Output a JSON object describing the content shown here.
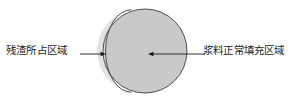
{
  "figure": {
    "type": "cross-section-diagram",
    "background_color": "#ffffff",
    "annotations": {
      "residue_label": "残渣所占区域",
      "slurry_label": "浆料正常填充区域"
    },
    "sphere": {
      "outline_color": "#4d4d4d",
      "center_x": 145,
      "center_y": 51,
      "radius": 42,
      "regions": [
        {
          "name": "residue-region",
          "label": "残渣所占区域",
          "fill_color": "#e2e2e2",
          "position": "left-crescent"
        },
        {
          "name": "slurry-region",
          "label": "浆料正常填充区域",
          "fill_color": "#c9c9c9",
          "position": "right-major"
        }
      ],
      "divider": {
        "name": "region-divider-arc",
        "stroke_color": "#4d4d4d"
      }
    },
    "leaders": [
      {
        "name": "residue-leader",
        "direction": "right",
        "x_start": 80,
        "x_end": 106,
        "y": 54,
        "color": "#1a1a1a"
      },
      {
        "name": "slurry-leader",
        "direction": "left",
        "x_start": 205,
        "x_end": 148,
        "y": 54,
        "color": "#1a1a1a"
      }
    ]
  }
}
